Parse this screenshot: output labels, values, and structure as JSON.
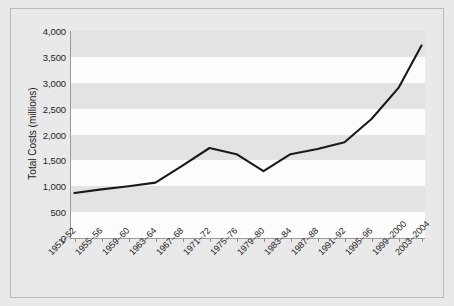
{
  "chart_data": {
    "type": "line",
    "title": "",
    "subtitle": "",
    "xlabel": "",
    "ylabel": "Total Costs (millions)",
    "ylim": [
      0,
      4000
    ],
    "ytick_labels": [
      "4,000",
      "3,500",
      "3,000",
      "2,500",
      "2,000",
      "1,500",
      "1,000",
      "500",
      "0"
    ],
    "ytick_values": [
      4000,
      3500,
      3000,
      2500,
      2000,
      1500,
      1000,
      500,
      0
    ],
    "grid": false,
    "alternating_bands": true,
    "legend": "none",
    "categories": [
      "1951–52",
      "1955–56",
      "1959–60",
      "1963–64",
      "1967–68",
      "1971–72",
      "1975–76",
      "1979–80",
      "1983–84",
      "1987–88",
      "1991–92",
      "1995–96",
      "1999–2000",
      "2003–2004"
    ],
    "values": [
      870,
      940,
      1000,
      1070,
      1400,
      1740,
      1620,
      1290,
      1620,
      1720,
      1850,
      2300,
      2900,
      3720
    ],
    "series": [
      {
        "name": "Total Costs",
        "values": [
          870,
          940,
          1000,
          1070,
          1400,
          1740,
          1620,
          1290,
          1620,
          1720,
          1850,
          2300,
          2900,
          3720
        ]
      }
    ],
    "colors": {
      "line": "#1a1a1a",
      "band_gray": "#e3e3e3",
      "band_white": "#fdfdfd",
      "figure_background": "#e9e9e9",
      "border": "#b9b9b9",
      "axis": "#9a9a9a",
      "text": "#262626"
    }
  }
}
